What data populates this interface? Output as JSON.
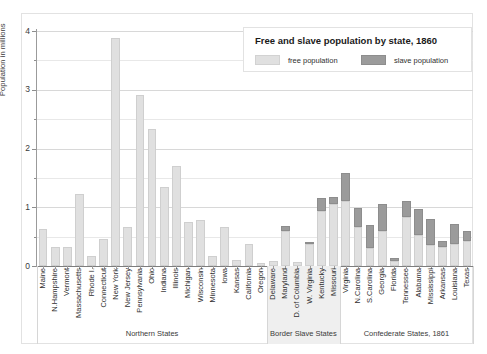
{
  "chart_data": {
    "type": "bar",
    "title": "Free and slave population by state, 1860",
    "xlabel": "",
    "ylabel": "Population in millions",
    "ylim": [
      0,
      4
    ],
    "yticks": [
      0,
      1,
      2,
      3,
      4
    ],
    "yticklabels": [
      "0",
      "1",
      "2",
      "3",
      "4"
    ],
    "minor_gridlines": [
      0.5,
      1.5,
      2.5,
      3.5
    ],
    "grid": true,
    "stacked": true,
    "legend_position": "upper right",
    "legend": [
      "free population",
      "slave population"
    ],
    "colors": {
      "free": "#e0e0e0",
      "slave": "#9b9b9b",
      "background": "#ffffff",
      "gridline": "#e8e8e8",
      "axis": "#8d8d8d",
      "band_tint": "#efefef",
      "text": "#2f2f2f"
    },
    "categories": [
      "Maine",
      "N.Hampshire",
      "Vermont",
      "Massachusetts",
      "Rhode I.",
      "Connecticut",
      "New York",
      "New Jersey",
      "Pennsylvania",
      "Ohio",
      "Indiana",
      "Illinois",
      "Michigan",
      "Wisconsin",
      "Minnesota",
      "Iowa",
      "Kansas",
      "California",
      "Oregon",
      "Delaware",
      "Maryland",
      "D. of Columbia",
      "W. Virginia",
      "Kentucky",
      "Missouri",
      "Virginia",
      "N.Carolina",
      "S.Carolina",
      "Georgia",
      "Florida",
      "Tennessee",
      "Alabama",
      "Mississippi",
      "Arkansas",
      "Louisiana",
      "Texas"
    ],
    "series": [
      {
        "name": "free population",
        "values": [
          0.63,
          0.33,
          0.32,
          1.23,
          0.17,
          0.46,
          3.88,
          0.67,
          2.91,
          2.34,
          1.35,
          1.71,
          0.75,
          0.78,
          0.17,
          0.67,
          0.11,
          0.38,
          0.05,
          0.09,
          0.6,
          0.072,
          0.37,
          0.93,
          1.06,
          1.1,
          0.66,
          0.3,
          0.6,
          0.078,
          0.83,
          0.53,
          0.36,
          0.32,
          0.38,
          0.42
        ]
      },
      {
        "name": "slave population",
        "values": [
          0,
          0,
          0,
          0,
          0,
          0,
          0,
          0,
          0,
          0,
          0,
          0,
          0,
          0,
          0,
          0,
          2e-06,
          0,
          0,
          0.0018,
          0.087,
          0.0031,
          0.018,
          0.225,
          0.115,
          0.49,
          0.331,
          0.402,
          0.462,
          0.062,
          0.276,
          0.435,
          0.437,
          0.111,
          0.332,
          0.183
        ]
      }
    ],
    "groups": [
      {
        "label": "Northern States",
        "start": "Maine",
        "end": "Oregon",
        "tinted": false
      },
      {
        "label": "Border Slave States",
        "start": "Delaware",
        "end": "Missouri",
        "tinted": true
      },
      {
        "label": "Confederate States, 1861",
        "start": "Virginia",
        "end": "Texas",
        "tinted": false
      }
    ]
  }
}
